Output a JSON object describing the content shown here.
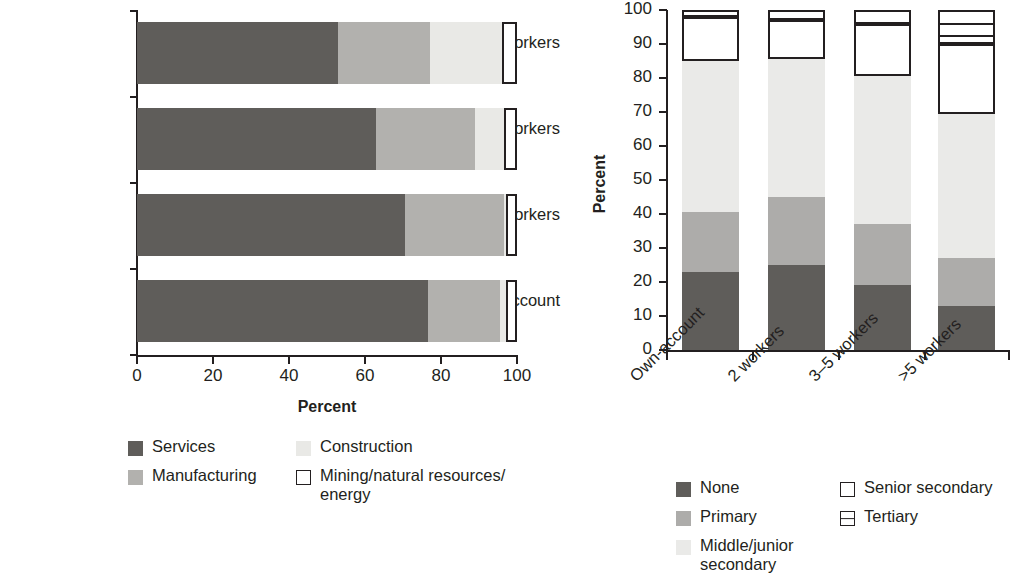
{
  "chart_data": [
    {
      "type": "bar",
      "id": "left-chart",
      "orientation": "horizontal",
      "stacked": true,
      "title": "",
      "xlabel": "Percent",
      "ylabel": "",
      "xlim": [
        0,
        100
      ],
      "xticks": [
        0,
        20,
        40,
        60,
        80,
        100
      ],
      "xtick_labels": [
        "0",
        "20",
        "40",
        "60",
        "80",
        "100"
      ],
      "grid": false,
      "legend_position": "bottom",
      "categories": [
        "Own-account",
        "2 workers",
        "3–5 workers",
        ">5 workers"
      ],
      "series": [
        {
          "name": "Services",
          "color": "#5f5d5a",
          "values": [
            76.5,
            70.5,
            63.0,
            53.0
          ]
        },
        {
          "name": "Manufacturing",
          "color": "#b2b1ae",
          "values": [
            19.0,
            26.0,
            26.0,
            24.0
          ]
        },
        {
          "name": "Construction",
          "color": "#e9e9e6",
          "values": [
            1.5,
            0.5,
            7.5,
            19.0
          ]
        },
        {
          "name": "Mining/natural resources/ energy",
          "color": "#ffffff",
          "values": [
            3.0,
            3.0,
            3.5,
            4.0
          ]
        }
      ],
      "legend_entries": [
        {
          "label": "Services",
          "swatch": "filled",
          "color": "#5f5d5a"
        },
        {
          "label": "Construction",
          "swatch": "filled",
          "color": "#e9e9e6"
        },
        {
          "label": "Manufacturing",
          "swatch": "filled",
          "color": "#b2b1ae"
        },
        {
          "label": "Mining/natural resources/\nenergy",
          "swatch": "open",
          "color": "#ffffff"
        }
      ]
    },
    {
      "type": "bar",
      "id": "right-chart",
      "orientation": "vertical",
      "stacked": true,
      "title": "",
      "xlabel": "",
      "ylabel": "Percent",
      "ylim": [
        0,
        100
      ],
      "yticks": [
        0,
        10,
        20,
        30,
        40,
        50,
        60,
        70,
        80,
        90,
        100
      ],
      "ytick_labels": [
        "0",
        "10",
        "20",
        "30",
        "40",
        "50",
        "60",
        "70",
        "80",
        "90",
        "100"
      ],
      "grid": false,
      "legend_position": "bottom",
      "categories": [
        "Own-account",
        "2 workers",
        "3–5 workers",
        ">5 workers"
      ],
      "series": [
        {
          "name": "None",
          "color": "#5f5d5a",
          "values": [
            23.0,
            25.0,
            19.0,
            13.0
          ]
        },
        {
          "name": "Primary",
          "color": "#adacaa",
          "values": [
            17.5,
            20.0,
            18.0,
            14.0
          ]
        },
        {
          "name": "Middle/junior secondary",
          "color": "#eaeae8",
          "values": [
            44.5,
            40.5,
            43.5,
            42.5
          ]
        },
        {
          "name": "Senior secondary",
          "color": "#ffffff",
          "values": [
            13.0,
            11.5,
            15.5,
            20.5
          ]
        },
        {
          "name": "Tertiary",
          "color": "#ffffff",
          "values": [
            2.0,
            3.0,
            4.0,
            10.0
          ]
        }
      ],
      "legend_entries": [
        {
          "label": "None",
          "swatch": "filled",
          "color": "#5f5d5a"
        },
        {
          "label": "Senior secondary",
          "swatch": "open",
          "color": "#ffffff"
        },
        {
          "label": "Primary",
          "swatch": "filled",
          "color": "#adacaa"
        },
        {
          "label": "Tertiary",
          "swatch": "hatch",
          "color": "#ffffff"
        },
        {
          "label": "Middle/junior\nsecondary",
          "swatch": "filled",
          "color": "#eaeae8"
        }
      ]
    }
  ],
  "left": {
    "xtitle": "Percent",
    "cats": {
      "c0": "Own-account",
      "c1": "2 workers",
      "c2": "3–5 workers",
      "c3": ">5 workers"
    },
    "xticks": {
      "t0": "0",
      "t1": "20",
      "t2": "40",
      "t3": "60",
      "t4": "80",
      "t5": "100"
    },
    "legend": {
      "services": "Services",
      "construction": "Construction",
      "manufacturing": "Manufacturing",
      "mining_line1": "Mining/natural resources/",
      "mining_line2": "energy"
    }
  },
  "right": {
    "ytitle": "Percent",
    "cats": {
      "c0": "Own-account",
      "c1": "2 workers",
      "c2": "3–5 workers",
      "c3": ">5 workers"
    },
    "yticks": {
      "t0": "0",
      "t10": "10",
      "t20": "20",
      "t30": "30",
      "t40": "40",
      "t50": "50",
      "t60": "60",
      "t70": "70",
      "t80": "80",
      "t90": "90",
      "t100": "100"
    },
    "legend": {
      "none": "None",
      "senior": "Senior secondary",
      "primary": "Primary",
      "tertiary": "Tertiary",
      "middle_line1": "Middle/junior",
      "middle_line2": "secondary"
    }
  }
}
